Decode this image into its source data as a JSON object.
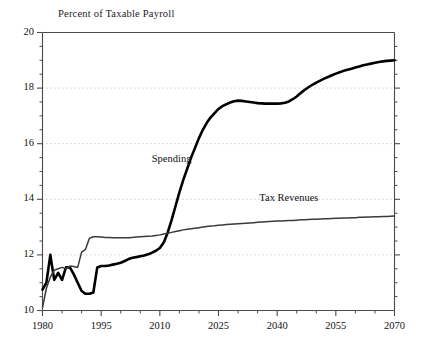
{
  "chart_data": {
    "type": "line",
    "title": "Percent of Taxable Payroll",
    "xlabel": "",
    "ylabel": "",
    "xlim": [
      1980,
      2070
    ],
    "ylim": [
      10,
      20
    ],
    "grid": true,
    "grid_axis": "y",
    "grid_style": "dotted",
    "legend_position": "inline-annotation",
    "y_ticks": [
      10,
      12,
      14,
      16,
      18,
      20
    ],
    "y_tick_labels": [
      "10",
      "12",
      "14",
      "16",
      "18",
      "20"
    ],
    "y_minor_tick_step": 0.5,
    "x_ticks": [
      1980,
      1995,
      2010,
      2025,
      2040,
      2055,
      2070
    ],
    "x_tick_labels": [
      "1980",
      "1995",
      "2010",
      "2025",
      "2040",
      "2055",
      "2070"
    ],
    "x_minor_tick_step": 5,
    "series": [
      {
        "name": "Spending",
        "color": "#000000",
        "line_width": 2.6,
        "x": [
          1980,
          1981,
          1982,
          1983,
          1984,
          1985,
          1986,
          1987,
          1988,
          1989,
          1990,
          1991,
          1992,
          1993,
          1994,
          1995,
          1996,
          1997,
          1998,
          1999,
          2000,
          2001,
          2002,
          2003,
          2004,
          2005,
          2006,
          2007,
          2008,
          2009,
          2010,
          2011,
          2012,
          2013,
          2014,
          2015,
          2016,
          2017,
          2018,
          2019,
          2020,
          2021,
          2022,
          2023,
          2024,
          2025,
          2026,
          2027,
          2028,
          2029,
          2030,
          2031,
          2032,
          2033,
          2034,
          2035,
          2036,
          2037,
          2038,
          2039,
          2040,
          2041,
          2042,
          2043,
          2044,
          2045,
          2046,
          2047,
          2048,
          2049,
          2050,
          2051,
          2052,
          2053,
          2054,
          2055,
          2056,
          2057,
          2058,
          2059,
          2060,
          2061,
          2062,
          2063,
          2064,
          2065,
          2066,
          2067,
          2068,
          2069,
          2070
        ],
        "y": [
          10.75,
          11.0,
          12.0,
          11.1,
          11.35,
          11.1,
          11.55,
          11.55,
          11.3,
          11.0,
          10.7,
          10.6,
          10.6,
          10.65,
          11.55,
          11.6,
          11.6,
          11.62,
          11.65,
          11.68,
          11.72,
          11.78,
          11.85,
          11.9,
          11.92,
          11.95,
          11.98,
          12.02,
          12.08,
          12.15,
          12.25,
          12.45,
          12.8,
          13.25,
          13.75,
          14.25,
          14.7,
          15.1,
          15.5,
          15.85,
          16.2,
          16.5,
          16.75,
          16.95,
          17.1,
          17.25,
          17.35,
          17.42,
          17.48,
          17.53,
          17.55,
          17.54,
          17.52,
          17.5,
          17.48,
          17.46,
          17.45,
          17.44,
          17.44,
          17.44,
          17.44,
          17.45,
          17.47,
          17.52,
          17.6,
          17.7,
          17.82,
          17.93,
          18.03,
          18.12,
          18.2,
          18.27,
          18.34,
          18.4,
          18.46,
          18.52,
          18.57,
          18.62,
          18.66,
          18.7,
          18.74,
          18.78,
          18.82,
          18.85,
          18.88,
          18.91,
          18.94,
          18.96,
          18.98,
          18.99,
          19.0
        ]
      },
      {
        "name": "Tax Revenues",
        "color": "#3a3a3a",
        "line_width": 1.5,
        "x": [
          1980,
          1981,
          1982,
          1983,
          1984,
          1985,
          1986,
          1987,
          1988,
          1989,
          1990,
          1991,
          1992,
          1993,
          1994,
          1995,
          1996,
          1997,
          1998,
          1999,
          2000,
          2001,
          2002,
          2003,
          2004,
          2005,
          2006,
          2007,
          2008,
          2009,
          2010,
          2011,
          2012,
          2013,
          2014,
          2015,
          2016,
          2017,
          2018,
          2019,
          2020,
          2021,
          2022,
          2023,
          2024,
          2025,
          2026,
          2027,
          2028,
          2029,
          2030,
          2031,
          2032,
          2033,
          2034,
          2035,
          2036,
          2037,
          2038,
          2039,
          2040,
          2041,
          2042,
          2043,
          2044,
          2045,
          2046,
          2047,
          2048,
          2049,
          2050,
          2051,
          2052,
          2053,
          2054,
          2055,
          2056,
          2057,
          2058,
          2059,
          2060,
          2061,
          2062,
          2063,
          2064,
          2065,
          2066,
          2067,
          2068,
          2069,
          2070
        ],
        "y": [
          10.1,
          10.8,
          11.2,
          11.45,
          11.5,
          11.55,
          11.5,
          11.6,
          11.58,
          11.55,
          12.1,
          12.2,
          12.6,
          12.65,
          12.65,
          12.64,
          12.63,
          12.63,
          12.62,
          12.62,
          12.62,
          12.62,
          12.62,
          12.63,
          12.64,
          12.65,
          12.66,
          12.67,
          12.68,
          12.7,
          12.72,
          12.75,
          12.78,
          12.81,
          12.84,
          12.87,
          12.9,
          12.92,
          12.94,
          12.96,
          12.98,
          13.0,
          13.02,
          13.04,
          13.05,
          13.07,
          13.08,
          13.09,
          13.1,
          13.11,
          13.12,
          13.13,
          13.14,
          13.15,
          13.16,
          13.17,
          13.18,
          13.19,
          13.2,
          13.21,
          13.22,
          13.22,
          13.23,
          13.24,
          13.24,
          13.25,
          13.26,
          13.26,
          13.27,
          13.28,
          13.28,
          13.29,
          13.3,
          13.3,
          13.31,
          13.32,
          13.32,
          13.33,
          13.33,
          13.34,
          13.34,
          13.35,
          13.35,
          13.36,
          13.36,
          13.37,
          13.37,
          13.38,
          13.38,
          13.39,
          13.4
        ]
      }
    ],
    "annotations": [
      {
        "text": "Spending",
        "x": 2013,
        "y": 15.4
      },
      {
        "text": "Tax Revenues",
        "x": 2043,
        "y": 14.0
      }
    ],
    "colors": {
      "axis": "#4a4a4a",
      "grid": "#b9b9b9",
      "text": "#111111",
      "background": "#ffffff"
    }
  }
}
